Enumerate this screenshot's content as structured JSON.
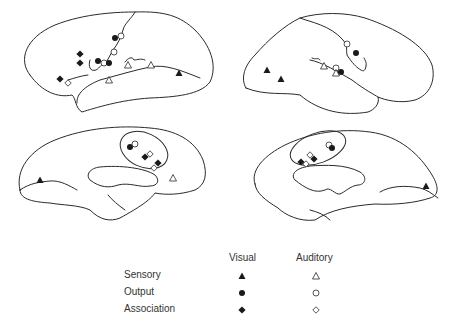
{
  "legend": {
    "columns": [
      "Visual",
      "Auditory"
    ],
    "rows": [
      {
        "label": "Sensory",
        "visual_marker": "filled-triangle",
        "auditory_marker": "open-triangle"
      },
      {
        "label": "Output",
        "visual_marker": "filled-circle",
        "auditory_marker": "open-circle"
      },
      {
        "label": "Association",
        "visual_marker": "filled-diamond",
        "auditory_marker": "open-diamond"
      }
    ]
  },
  "panels": [
    {
      "id": "left-lateral",
      "view": "lateral",
      "hemisphere": "left"
    },
    {
      "id": "right-lateral",
      "view": "lateral",
      "hemisphere": "right"
    },
    {
      "id": "left-medial",
      "view": "medial",
      "hemisphere": "left",
      "has_ellipse": true
    },
    {
      "id": "right-medial",
      "view": "medial",
      "hemisphere": "right",
      "has_ellipse": true
    }
  ],
  "colors": {
    "ink": "#1a1a1a",
    "background": "#ffffff"
  }
}
